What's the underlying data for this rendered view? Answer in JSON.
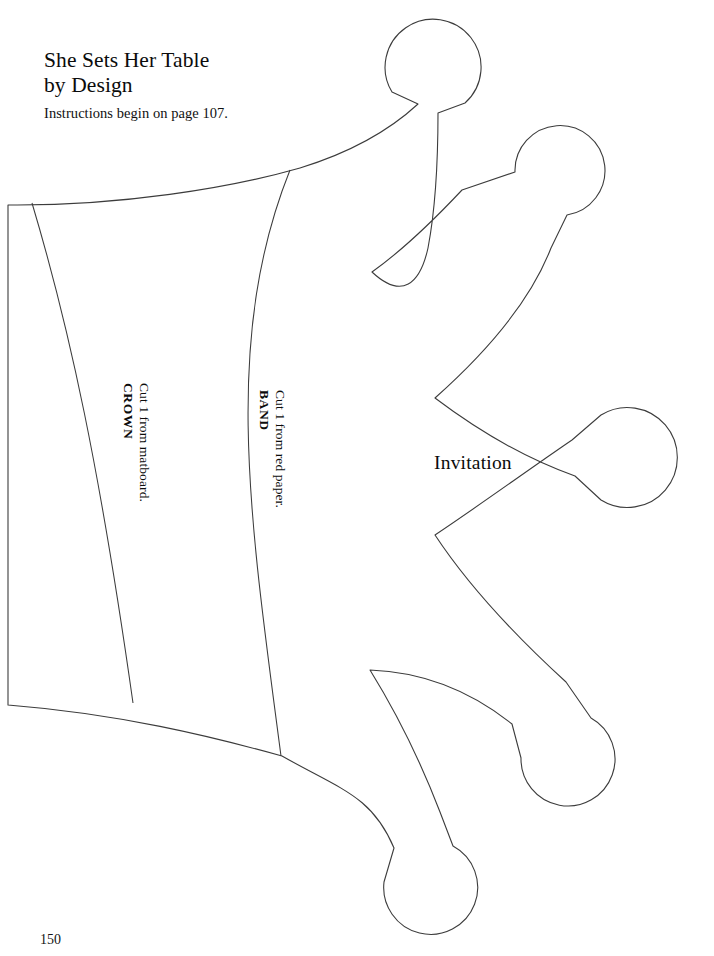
{
  "page": {
    "title_line1": "She Sets Her Table",
    "title_line2": "by Design",
    "title": "She Sets Her Table\nby Design",
    "instructions": "Instructions begin on page 107.",
    "folio": "150",
    "background_color": "#ffffff",
    "ink_color": "#000000"
  },
  "template": {
    "caption": "Invitation",
    "outline_color": "#3c3c3c",
    "fill_color": "#ffffff",
    "stroke_width": "1",
    "points_count": "5",
    "pieces": [
      {
        "id": "crown",
        "name": "CROWN",
        "note": "Cut 1 from matboard."
      },
      {
        "id": "band",
        "name": "BAND",
        "note": "Cut 1 from red paper."
      }
    ]
  }
}
